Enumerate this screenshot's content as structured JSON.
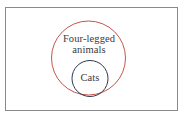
{
  "diagram": {
    "type": "euler-diagram",
    "title": "",
    "background_color": "#ffffff",
    "frame": {
      "name": "figure-border",
      "border_color": "#8a8a8a",
      "border_width_px": 1,
      "x": 5,
      "y": 7,
      "width": 173,
      "height": 104
    },
    "sets": [
      {
        "id": "outer",
        "label": "Four-legged\nanimals",
        "label_line1": "Four-legged",
        "label_line2": "animals",
        "shape": "circle",
        "stroke_color": "#c4564a",
        "stroke_width_px": 1,
        "fill": "none",
        "center_x": 88.5,
        "center_y": 58,
        "radius": 37,
        "text_color": "#3a3a42",
        "font_size_px": 10.5
      },
      {
        "id": "inner",
        "label": "Cats",
        "shape": "circle",
        "stroke_color": "#2d3a52",
        "stroke_width_px": 1,
        "fill": "none",
        "center_x": 90,
        "center_y": 78.5,
        "radius": 18,
        "text_color": "#3a3a42",
        "font_size_px": 10.5
      }
    ],
    "relation": "subset",
    "relation_description": "Cats is a subset of Four-legged animals"
  }
}
